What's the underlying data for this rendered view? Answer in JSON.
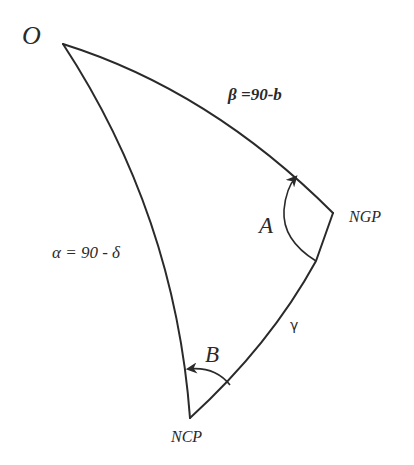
{
  "diagram": {
    "vertices": {
      "O": "O",
      "NGP": "NGP",
      "NCP": "NCP"
    },
    "sides": {
      "beta": "β =90-b",
      "alpha": "α = 90 - δ",
      "gamma": "γ"
    },
    "angles": {
      "A": "A",
      "B": "B"
    },
    "colors": {
      "stroke": "#2a2a2a",
      "background": "#ffffff"
    }
  }
}
